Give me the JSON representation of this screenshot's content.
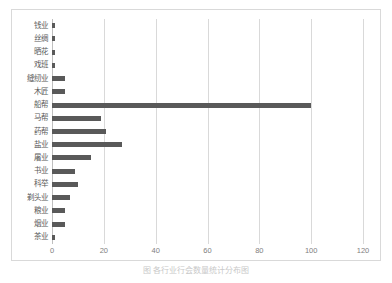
{
  "chart_data": {
    "type": "bar",
    "orientation": "horizontal",
    "title": "",
    "xlabel": "",
    "ylabel": "",
    "xlim": [
      0,
      120
    ],
    "ylim": null,
    "grid": "vertical",
    "legend": "none",
    "bar_color": "#595959",
    "gridline_color": "#d9d9d9",
    "axis_color": "#bfbfbf",
    "xticks": [
      0,
      20,
      40,
      60,
      80,
      100,
      120
    ],
    "xticklabels": [
      "0",
      "20",
      "40",
      "60",
      "80",
      "100",
      "120"
    ],
    "categories": [
      "钱业",
      "丝绸",
      "晒花",
      "戏班",
      "缝纫业",
      "木匠",
      "船帮",
      "马帮",
      "药帮",
      "盐业",
      "屠业",
      "书业",
      "科举",
      "剃头业",
      "粮业",
      "烟业",
      "茶业"
    ],
    "values": [
      1,
      1,
      1,
      1,
      5,
      5,
      100,
      19,
      21,
      27,
      15,
      9,
      10,
      7,
      5,
      5,
      1
    ]
  },
  "caption": {
    "text": "图  各行业行会数量统计分布图"
  }
}
